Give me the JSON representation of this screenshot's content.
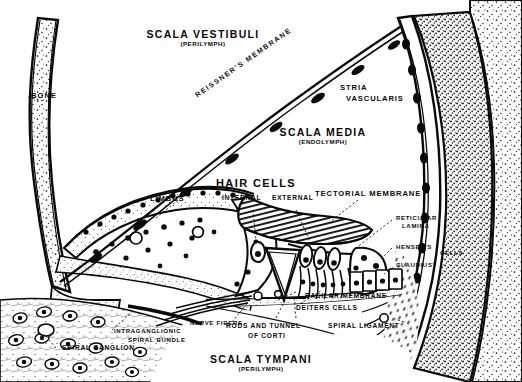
{
  "figure": {
    "background_color": "#ffffff",
    "ink_color": "#0a0a0a",
    "width": 522,
    "height": 382
  },
  "labels": {
    "scala_vestibuli": {
      "main": "SCALA VESTIBULI",
      "sub": "(PERILYMPH)"
    },
    "scala_media": {
      "main": "SCALA MEDIA",
      "sub": "(ENDOLYMPH)"
    },
    "scala_tympani": {
      "main": "SCALA TYMPANI",
      "sub": "(PERILYMPH)"
    },
    "hair_cells": "HAIR CELLS",
    "hair_internal": "INTERNAL",
    "hair_external": "EXTERNAL",
    "bone": "BONE",
    "reissners_membrane": "REISSNER'S MEMBRANE",
    "stria_vascularis_line1": "STRIA",
    "stria_vascularis_line2": "VASCULARIS",
    "limbus": "LIMBUS",
    "tectorial_membrane": "TECTORIAL MEMBRANE",
    "reticular_line1": "RETICULAR",
    "reticular_line2": "LAMINA",
    "hensens": "HENSEN'S",
    "claudius": "CLAUDIUS'",
    "cells": "CELLS",
    "basilar_membrane": "BASILAR MEMBRANE",
    "deiters_cells": "DEITERS CELLS",
    "spiral_ligament": "SPIRAL LIGAMENT",
    "nerve_fibers": "NERVE FIBERS",
    "rods_line1": "RODS AND TUNNEL",
    "rods_line2": "OF CORTI",
    "intraganglionic_line1": "INTRAGANGLIONIC",
    "intraganglionic_line2": "SPIRAL BUNDLE",
    "spiral_ganglion": "SPIRAL GANGLION"
  }
}
